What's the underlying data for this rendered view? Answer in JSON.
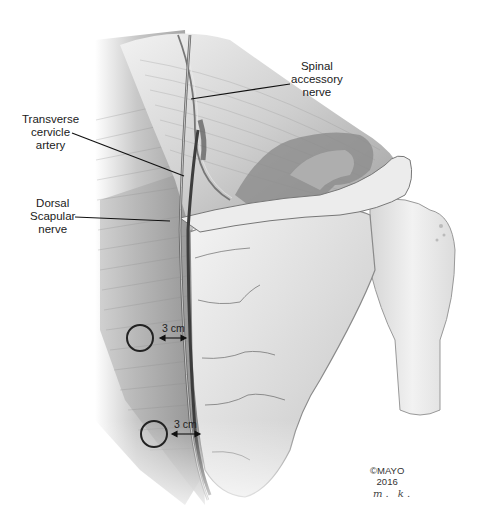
{
  "figure": {
    "palette": {
      "background": "#ffffff",
      "muscle_light": "#d9d9d9",
      "muscle_dark": "#9a9a9a",
      "bone": "#e6e6e6",
      "bone_shadow": "#b5b5b5",
      "leader_line": "#111111",
      "nerve": "#555555",
      "artery": "#444444"
    }
  },
  "labels": {
    "spinal_accessory_nerve": [
      "Spinal",
      "accessory",
      "nerve"
    ],
    "transverse_cervicle_artery": [
      "Transverse",
      "cervicle",
      "artery"
    ],
    "dorsal_scapular_nerve": [
      "Dorsal",
      "Scapular",
      "nerve"
    ]
  },
  "measurements": [
    {
      "label": "3 cm",
      "position": "upper"
    },
    {
      "label": "3 cm",
      "position": "lower"
    }
  ],
  "credit": {
    "copyright": "©MAYO",
    "year": "2016",
    "signature": "m. k."
  }
}
